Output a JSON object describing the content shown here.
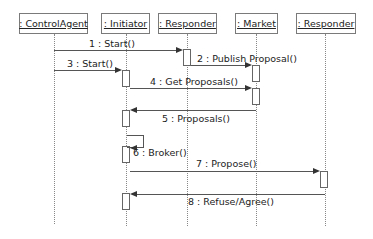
{
  "diagram": {
    "type": "uml-sequence",
    "participants": [
      {
        "id": "controlagent",
        "label": ": ControlAgent"
      },
      {
        "id": "initiator",
        "label": ": Initiator"
      },
      {
        "id": "responder1",
        "label": ": Responder"
      },
      {
        "id": "market",
        "label": ": Market"
      },
      {
        "id": "responder2",
        "label": ": Responder"
      }
    ],
    "messages": [
      {
        "num": 1,
        "label": "1 : Start()",
        "from": "controlagent",
        "to": "responder1"
      },
      {
        "num": 2,
        "label": "2 : Publish Proposal()",
        "from": "responder1",
        "to": "market"
      },
      {
        "num": 3,
        "label": "3 : Start()",
        "from": "controlagent",
        "to": "initiator"
      },
      {
        "num": 4,
        "label": "4 : Get Proposals()",
        "from": "initiator",
        "to": "market"
      },
      {
        "num": 5,
        "label": "5 : Proposals()",
        "from": "market",
        "to": "initiator"
      },
      {
        "num": 6,
        "label": "6 : Broker()",
        "from": "initiator",
        "to": "initiator"
      },
      {
        "num": 7,
        "label": "7 : Propose()",
        "from": "initiator",
        "to": "responder2"
      },
      {
        "num": 8,
        "label": "8 : Refuse/Agree()",
        "from": "responder2",
        "to": "initiator"
      }
    ]
  }
}
